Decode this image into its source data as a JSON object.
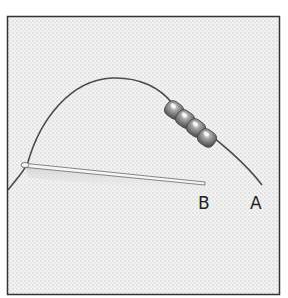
{
  "figure": {
    "bead_count": 4,
    "labels": {
      "b": "B",
      "a": "A"
    },
    "colors": {
      "background": "#ffffff",
      "fabric": "#f0f0f0",
      "frame": "#333333",
      "thread": "#4a4a4a",
      "bead": "#8a8a8a",
      "needle": "#f4f4f4"
    }
  }
}
